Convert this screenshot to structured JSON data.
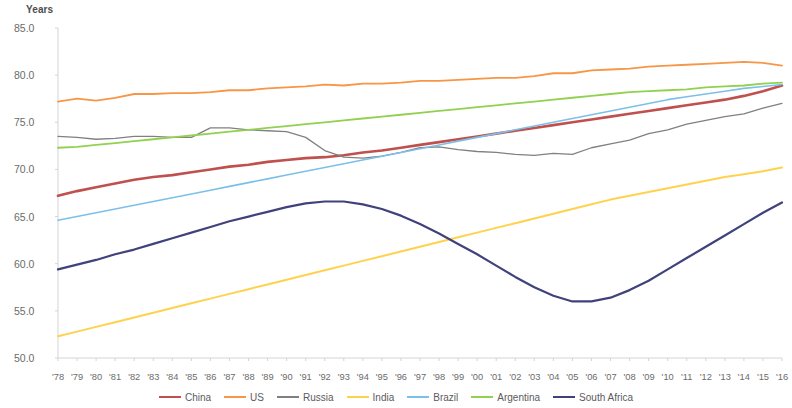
{
  "chart_data": {
    "type": "line",
    "title": "",
    "subtitle": "",
    "xlabel": "",
    "ylabel": "Years",
    "ylim": [
      50.0,
      85.0
    ],
    "y_ticks": [
      "50.0",
      "55.0",
      "60.0",
      "65.0",
      "70.0",
      "75.0",
      "80.0",
      "85.0"
    ],
    "y_tick_values": [
      50.0,
      55.0,
      60.0,
      65.0,
      70.0,
      75.0,
      80.0,
      85.0
    ],
    "grid": false,
    "legend_position": "bottom",
    "x": [
      1978,
      1979,
      1980,
      1981,
      1982,
      1983,
      1984,
      1985,
      1986,
      1987,
      1988,
      1989,
      1990,
      1991,
      1992,
      1993,
      1994,
      1995,
      1996,
      1997,
      1998,
      1999,
      2000,
      2001,
      2002,
      2003,
      2004,
      2005,
      2006,
      2007,
      2008,
      2009,
      2010,
      2011,
      2012,
      2013,
      2014,
      2015,
      2016
    ],
    "categories": [
      "'78",
      "'79",
      "'80",
      "'81",
      "'82",
      "'83",
      "'84",
      "'85",
      "'86",
      "'87",
      "'88",
      "'89",
      "'90",
      "'91",
      "'92",
      "'93",
      "'94",
      "'95",
      "'96",
      "'97",
      "'98",
      "'99",
      "'00",
      "'01",
      "'02",
      "'03",
      "'04",
      "'05",
      "'06",
      "'07",
      "'08",
      "'09",
      "'10",
      "'11",
      "'12",
      "'13",
      "'14",
      "'15",
      "'16"
    ],
    "series": [
      {
        "name": "China",
        "color": "#c0504d",
        "width": 2.6,
        "values": [
          67.2,
          67.7,
          68.1,
          68.5,
          68.9,
          69.2,
          69.4,
          69.7,
          70.0,
          70.3,
          70.5,
          70.8,
          71.0,
          71.2,
          71.3,
          71.5,
          71.8,
          72.0,
          72.3,
          72.6,
          72.9,
          73.2,
          73.5,
          73.8,
          74.1,
          74.4,
          74.7,
          75.0,
          75.3,
          75.6,
          75.9,
          76.2,
          76.5,
          76.8,
          77.1,
          77.4,
          77.8,
          78.3,
          78.9
        ]
      },
      {
        "name": "US",
        "color": "#f79646",
        "width": 1.8,
        "values": [
          77.2,
          77.5,
          77.3,
          77.6,
          78.0,
          78.0,
          78.1,
          78.1,
          78.2,
          78.4,
          78.4,
          78.6,
          78.7,
          78.8,
          79.0,
          78.9,
          79.1,
          79.1,
          79.2,
          79.4,
          79.4,
          79.5,
          79.6,
          79.7,
          79.7,
          79.9,
          80.2,
          80.2,
          80.5,
          80.6,
          80.7,
          80.9,
          81.0,
          81.1,
          81.2,
          81.3,
          81.4,
          81.3,
          81.0
        ]
      },
      {
        "name": "Russia",
        "color": "#808080",
        "width": 1.3,
        "values": [
          73.5,
          73.4,
          73.2,
          73.3,
          73.5,
          73.5,
          73.4,
          73.4,
          74.4,
          74.4,
          74.2,
          74.1,
          74.0,
          73.4,
          72.0,
          71.3,
          71.2,
          71.4,
          71.8,
          72.3,
          72.4,
          72.1,
          71.9,
          71.8,
          71.6,
          71.5,
          71.7,
          71.6,
          72.3,
          72.7,
          73.1,
          73.8,
          74.2,
          74.8,
          75.2,
          75.6,
          75.9,
          76.5,
          77.0
        ]
      },
      {
        "name": "India",
        "color": "#ffd24d",
        "width": 2.0,
        "values": [
          52.3,
          52.8,
          53.3,
          53.8,
          54.3,
          54.8,
          55.3,
          55.8,
          56.3,
          56.8,
          57.3,
          57.8,
          58.3,
          58.8,
          59.3,
          59.8,
          60.3,
          60.8,
          61.3,
          61.8,
          62.3,
          62.8,
          63.3,
          63.8,
          64.3,
          64.8,
          65.3,
          65.8,
          66.3,
          66.8,
          67.2,
          67.6,
          68.0,
          68.4,
          68.8,
          69.2,
          69.5,
          69.8,
          70.2
        ]
      },
      {
        "name": "Brazil",
        "color": "#7cc0e8",
        "width": 1.6,
        "values": [
          64.6,
          65.0,
          65.4,
          65.8,
          66.2,
          66.6,
          67.0,
          67.4,
          67.8,
          68.2,
          68.6,
          69.0,
          69.4,
          69.8,
          70.2,
          70.6,
          71.0,
          71.4,
          71.8,
          72.2,
          72.6,
          73.0,
          73.4,
          73.8,
          74.2,
          74.6,
          75.0,
          75.4,
          75.8,
          76.2,
          76.6,
          77.0,
          77.4,
          77.7,
          78.0,
          78.3,
          78.6,
          78.8,
          79.0
        ]
      },
      {
        "name": "Argentina",
        "color": "#92d050",
        "width": 1.8,
        "values": [
          72.3,
          72.4,
          72.6,
          72.8,
          73.0,
          73.2,
          73.4,
          73.6,
          73.8,
          74.0,
          74.2,
          74.4,
          74.6,
          74.8,
          75.0,
          75.2,
          75.4,
          75.6,
          75.8,
          76.0,
          76.2,
          76.4,
          76.6,
          76.8,
          77.0,
          77.2,
          77.4,
          77.6,
          77.8,
          78.0,
          78.2,
          78.3,
          78.4,
          78.5,
          78.7,
          78.8,
          78.9,
          79.1,
          79.2
        ]
      },
      {
        "name": "South Africa",
        "color": "#40427c",
        "width": 2.2,
        "values": [
          59.4,
          59.9,
          60.4,
          61.0,
          61.5,
          62.1,
          62.7,
          63.3,
          63.9,
          64.5,
          65.0,
          65.5,
          66.0,
          66.4,
          66.6,
          66.6,
          66.3,
          65.8,
          65.1,
          64.2,
          63.2,
          62.1,
          61.0,
          59.8,
          58.6,
          57.5,
          56.6,
          56.0,
          56.0,
          56.4,
          57.2,
          58.2,
          59.4,
          60.6,
          61.8,
          63.0,
          64.2,
          65.4,
          66.5
        ]
      }
    ]
  },
  "legend": {
    "items": [
      {
        "label": "China"
      },
      {
        "label": "US"
      },
      {
        "label": "Russia"
      },
      {
        "label": "India"
      },
      {
        "label": "Brazil"
      },
      {
        "label": "Argentina"
      },
      {
        "label": "South Africa"
      }
    ]
  }
}
